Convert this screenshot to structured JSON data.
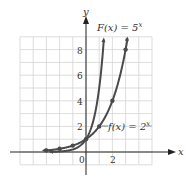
{
  "chart_data": {
    "type": "line",
    "title": "",
    "xlabel": "x",
    "ylabel": "y",
    "xlim": [
      -5,
      5
    ],
    "ylim": [
      -1,
      9
    ],
    "grid": true,
    "x_ticks_labeled": [
      "0",
      "2"
    ],
    "y_ticks_labeled": [
      "2",
      "4",
      "6",
      "8"
    ],
    "series": [
      {
        "name": "F(x) = 5^x",
        "label": "F(x) = 5",
        "exponent": "x",
        "function": "5^x",
        "x": [
          -2,
          -1,
          0,
          1,
          1.35
        ],
        "y": [
          0.04,
          0.2,
          1,
          5,
          8.8
        ],
        "marked_points": []
      },
      {
        "name": "f(x) = 2^x",
        "label": "f(x) = 2",
        "exponent": "x",
        "function": "2^x",
        "x": [
          -3,
          -2,
          -1,
          0,
          1,
          2,
          3,
          3.15
        ],
        "y": [
          0.125,
          0.25,
          0.5,
          1,
          2,
          4,
          8,
          8.9
        ],
        "marked_points": [
          [
            -3,
            0.125
          ],
          [
            -2,
            0.25
          ],
          [
            -1,
            0.5
          ],
          [
            0,
            1
          ],
          [
            1,
            2
          ],
          [
            2,
            4
          ],
          [
            3,
            8
          ]
        ]
      }
    ],
    "annotations": [
      "F(x) = 5^x",
      "f(x) = 2^x"
    ]
  }
}
